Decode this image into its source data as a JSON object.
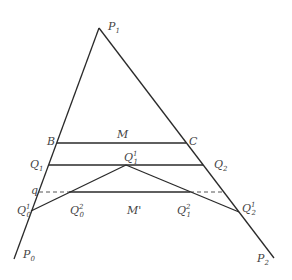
{
  "diagram": {
    "labels": {
      "P1": {
        "base": "P",
        "sub": "1",
        "sup": ""
      },
      "P0": {
        "base": "P",
        "sub": "0",
        "sup": ""
      },
      "P2": {
        "base": "P",
        "sub": "2",
        "sup": ""
      },
      "B": {
        "base": "B",
        "sub": "",
        "sup": ""
      },
      "C": {
        "base": "C",
        "sub": "",
        "sup": ""
      },
      "M": {
        "base": "M",
        "sub": "",
        "sup": ""
      },
      "Q1": {
        "base": "Q",
        "sub": "1",
        "sup": ""
      },
      "Q2": {
        "base": "Q",
        "sub": "2",
        "sup": ""
      },
      "Q1_1": {
        "base": "Q",
        "sub": "1",
        "sup": "1"
      },
      "q": {
        "base": "q",
        "sub": "",
        "sup": ""
      },
      "Q0_1": {
        "base": "Q",
        "sub": "0",
        "sup": "1"
      },
      "Q0_2": {
        "base": "Q",
        "sub": "0",
        "sup": "2"
      },
      "Mprime": {
        "base": "M'",
        "sub": "",
        "sup": ""
      },
      "Q1_2": {
        "base": "Q",
        "sub": "1",
        "sup": "2"
      },
      "Q2_1": {
        "base": "Q",
        "sub": "2",
        "sup": "1"
      }
    }
  }
}
